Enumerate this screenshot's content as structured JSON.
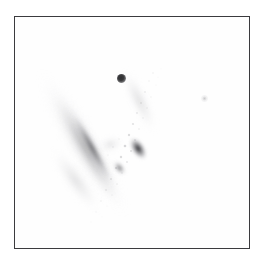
{
  "plate": {
    "name": "astronomical-image-plate",
    "width": 265,
    "height": 269,
    "background_color": "#ffffff",
    "alt_text": "Negative grayscale astronomical image of an edge-on spiral galaxy with a foreground star, inside a thin rectangular frame"
  },
  "frame": {
    "name": "image-frame",
    "left": 14,
    "top": 16,
    "width": 236,
    "height": 233,
    "border_color": "#3b3b3e",
    "border_width": 1.4,
    "fill_color": "#fefefe"
  },
  "objects": {
    "star_main": {
      "label": "foreground-star",
      "x": 120,
      "y": 77,
      "radius": 4.5,
      "color": "#2e2e30"
    },
    "star_faint": {
      "label": "faint-point-source",
      "x": 203,
      "y": 97,
      "radius": 3.5,
      "color": "#9a9a9e"
    },
    "galaxy": {
      "label": "edge-on-spiral-galaxy",
      "core_x": 146,
      "core_y": 150,
      "position_angle_deg": -30,
      "major_axis_px": 165,
      "minor_axis_px": 30,
      "core_color": "#1a1a1e",
      "halo_color": "#c4c4c8"
    }
  },
  "colors": {
    "background": "#ffffff",
    "sky": "#fefefe",
    "frame_border": "#3b3b3e",
    "source_dark": "#2e2e30",
    "halo_light": "#e8e8ea"
  },
  "chart_data": {
    "type": "scatter",
    "title": "",
    "xlabel": "",
    "ylabel": "",
    "grid": false,
    "legend": "none",
    "xlim": [
      14,
      250
    ],
    "ylim": [
      16,
      249
    ],
    "annotations": [],
    "series": [
      {
        "name": "point-sources",
        "points": [
          {
            "x": 120,
            "y": 77,
            "intensity": 0.92,
            "size": 9
          },
          {
            "x": 203,
            "y": 97,
            "intensity": 0.18,
            "size": 6
          }
        ]
      },
      {
        "name": "galaxy-ridgeline",
        "points": [
          {
            "x": 181,
            "y": 68,
            "intensity": 0.06
          },
          {
            "x": 174,
            "y": 81,
            "intensity": 0.09
          },
          {
            "x": 168,
            "y": 95,
            "intensity": 0.13
          },
          {
            "x": 162,
            "y": 108,
            "intensity": 0.18
          },
          {
            "x": 157,
            "y": 121,
            "intensity": 0.26
          },
          {
            "x": 152,
            "y": 133,
            "intensity": 0.4
          },
          {
            "x": 147,
            "y": 145,
            "intensity": 0.74
          },
          {
            "x": 143,
            "y": 155,
            "intensity": 0.82
          },
          {
            "x": 137,
            "y": 164,
            "intensity": 0.58
          },
          {
            "x": 130,
            "y": 172,
            "intensity": 0.46
          },
          {
            "x": 123,
            "y": 179,
            "intensity": 0.34
          },
          {
            "x": 115,
            "y": 186,
            "intensity": 0.22
          },
          {
            "x": 107,
            "y": 193,
            "intensity": 0.14
          },
          {
            "x": 99,
            "y": 200,
            "intensity": 0.08
          },
          {
            "x": 93,
            "y": 206,
            "intensity": 0.04
          }
        ]
      }
    ]
  }
}
